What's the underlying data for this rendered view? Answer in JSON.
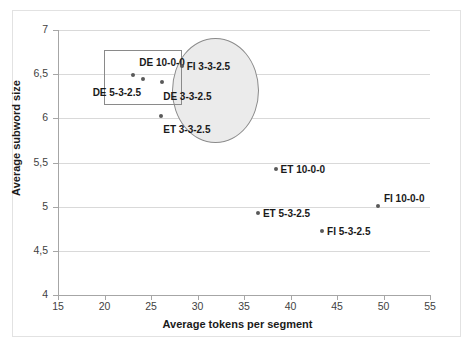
{
  "chart_data": {
    "type": "scatter",
    "title": "",
    "xlabel": "Average tokens per segment",
    "ylabel": "Average subword size",
    "xlim": [
      15,
      55
    ],
    "ylim": [
      4,
      7
    ],
    "xticks": [
      "15",
      "20",
      "25",
      "30",
      "35",
      "40",
      "45",
      "50",
      "55"
    ],
    "yticks": [
      "4",
      "4,5",
      "5",
      "5,5",
      "6",
      "6,5",
      "7"
    ],
    "xtick_values": [
      15,
      20,
      25,
      30,
      35,
      40,
      45,
      50,
      55
    ],
    "ytick_values": [
      4,
      4.5,
      5,
      5.5,
      6,
      6.5,
      7
    ],
    "grid": "horizontal",
    "legend": "none",
    "decimal_separator": ",",
    "points": [
      {
        "label": "DE 10-0-0",
        "x": 23.1,
        "y": 6.49,
        "label_dx": 6,
        "label_dy": -18,
        "label_align": "left"
      },
      {
        "label": "DE 5-3-2.5",
        "x": 24.1,
        "y": 6.45,
        "label_dx": -50,
        "label_dy": 8,
        "label_align": "left"
      },
      {
        "label": "DE 3-3-2.5",
        "x": 26.2,
        "y": 6.41,
        "label_dx": 1,
        "label_dy": 9,
        "label_align": "left"
      },
      {
        "label": "FI 3-3-2.5",
        "x": 28.3,
        "y": 6.59,
        "label_dx": 5,
        "label_dy": -5,
        "label_align": "left"
      },
      {
        "label": "ET 3-3-2.5",
        "x": 26.1,
        "y": 6.03,
        "label_dx": 2,
        "label_dy": 8,
        "label_align": "left"
      },
      {
        "label": "ET 10-0-0",
        "x": 38.4,
        "y": 5.43,
        "label_dx": 5,
        "label_dy": -5,
        "label_align": "left"
      },
      {
        "label": "FI 10-0-0",
        "x": 49.4,
        "y": 5.01,
        "label_dx": 6,
        "label_dy": -13,
        "label_align": "left"
      },
      {
        "label": "ET 5-3-2.5",
        "x": 36.5,
        "y": 4.93,
        "label_dx": 5,
        "label_dy": -5,
        "label_align": "left"
      },
      {
        "label": "FI 5-3-2.5",
        "x": 43.4,
        "y": 4.72,
        "label_dx": 5,
        "label_dy": -5,
        "label_align": "left"
      }
    ],
    "annotations": [
      {
        "name": "cluster-ellipse",
        "shape": "ellipse",
        "x_range": [
          27.3,
          36.6
        ],
        "y_range": [
          5.72,
          6.91
        ],
        "fill": "#ebebeb",
        "stroke": "#8a8a8a"
      },
      {
        "name": "cluster-rectangle",
        "shape": "rect",
        "x_range": [
          19.9,
          28.3
        ],
        "y_range": [
          6.15,
          6.77
        ],
        "fill": "none",
        "stroke": "#8a8a8a"
      }
    ],
    "colors": {
      "marker": "#595959",
      "gridline": "#d9d9d9",
      "axis": "#a6a6a6",
      "text": "#1a1a1a",
      "ellipse_fill": "#ebebeb",
      "annotation_stroke": "#8a8a8a",
      "background": "#ffffff"
    }
  }
}
